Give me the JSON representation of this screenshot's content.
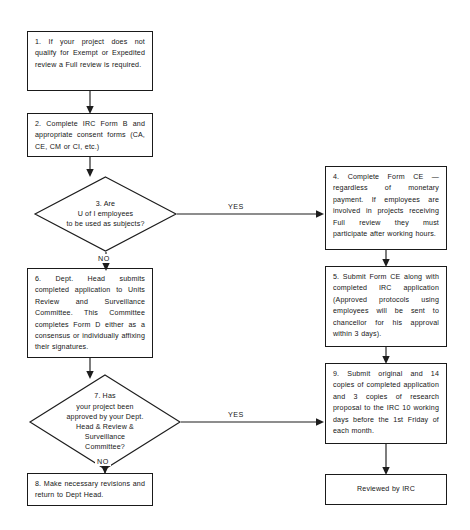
{
  "diagram": {
    "type": "flowchart",
    "background_color": "#ffffff",
    "line_color": "#1d1d1d",
    "text_color": "#161616"
  },
  "nodes": {
    "step1": {
      "id": "1",
      "shape": "rectangle",
      "text": "1. If your project does not qualify for Exempt or Expedited review a Full review is required."
    },
    "step2": {
      "id": "2",
      "shape": "rectangle",
      "text": "2. Complete IRC Form B and appropriate consent forms (CA, CE, CM or CI, etc.)"
    },
    "step3": {
      "id": "3",
      "shape": "diamond",
      "line1": "3. Are",
      "line2": "U of I employees",
      "line3": "to be used as subjects?"
    },
    "step4": {
      "id": "4",
      "shape": "rectangle",
      "text": "4. Complete Form CE — regardless of monetary payment. If employees are involved in projects receiving Full review they must participate after working hours."
    },
    "step5": {
      "id": "5",
      "shape": "rectangle",
      "text": "5. Submit Form CE along with completed IRC application (Approved protocols using employees will be sent to chancellor for his approval within 3 days)."
    },
    "step6": {
      "id": "6",
      "shape": "rectangle",
      "text": "6. Dept. Head submits completed application to Units Review and Surveillance Committee. This Committee completes Form D either as a consensus or individually affixing their signatures."
    },
    "step7": {
      "id": "7",
      "shape": "diamond",
      "line1": "7. Has",
      "line2": "your project been",
      "line3": "approved by your Dept.",
      "line4": "Head & Review &",
      "line5": "Surveillance",
      "line6": "Committee?"
    },
    "step8": {
      "id": "8",
      "shape": "rectangle",
      "text": "8. Make necessary revisions and return to Dept Head."
    },
    "step9": {
      "id": "9",
      "shape": "rectangle",
      "text": "9. Submit original and 14 copies of completed application and 3 copies of research proposal to the IRC 10 working days before the 1st Friday of each month."
    },
    "terminal": {
      "id": "terminal",
      "shape": "rectangle",
      "text": "Reviewed by IRC"
    }
  },
  "edge_labels": {
    "d3_yes": "YES",
    "d3_no": "NO",
    "d7_yes": "YES",
    "d7_no": "NO"
  }
}
